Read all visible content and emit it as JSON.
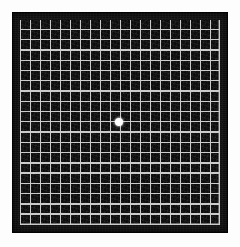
{
  "document": {
    "title": "Amsler Grid",
    "type": "vision-test-chart",
    "description": "Amsler grid: white square grid lines on a black field with a central white fixation dot, surrounded by a black border on a white page."
  },
  "colors": {
    "page_background": "#fdfdfd",
    "panel_background": "#141414",
    "grid_field": "#0d0d0d",
    "grid_line": "#c9c9c9",
    "fixation_dot": "#ffffff"
  },
  "grid": {
    "columns": 20,
    "rows": 20,
    "line_color": "#c9c9c9",
    "cell_color": "#0d0d0d",
    "line_width_px": 1.4,
    "cell_width_px": 10,
    "cell_height_px": 10.25
  },
  "panel": {
    "left_px": 12,
    "top_px": 12,
    "width_px": 216,
    "height_px": 221,
    "border_color": "#141414"
  },
  "fixation": {
    "label": "central fixation dot",
    "center_x_px": 119,
    "center_y_px": 122,
    "diameter_px": 8,
    "color": "#ffffff"
  },
  "chart_data": {
    "type": "heatmap",
    "xlabel": "",
    "ylabel": "",
    "categories": [],
    "values": [],
    "grid": true,
    "legend": "none"
  }
}
